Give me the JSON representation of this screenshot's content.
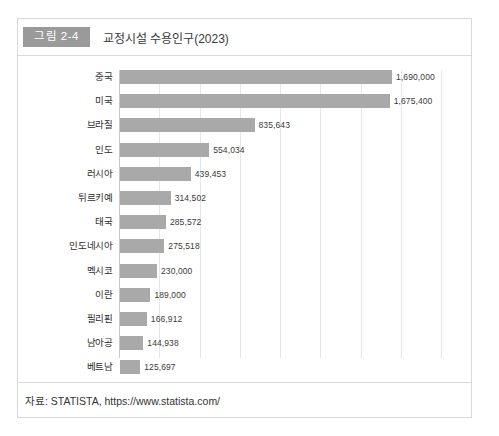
{
  "figure": {
    "badge": "그림 2-4",
    "title": "교정시설 수용인구(2023)",
    "source": "자료: STATISTA, https://www.statista.com/"
  },
  "colors": {
    "bar": "#a9a9a9",
    "badge_bg": "#9a9a9a",
    "grid": "#e6e6e6",
    "border": "#d9d9d9"
  },
  "chart_data": {
    "type": "bar",
    "orientation": "horizontal",
    "title": "교정시설 수용인구(2023)",
    "xlabel": "",
    "ylabel": "",
    "grid": true,
    "legend": "none",
    "xlim": [
      0,
      2000000
    ],
    "gridline_step": 250000,
    "categories": [
      "중국",
      "미국",
      "브라질",
      "인도",
      "러시아",
      "튀르키예",
      "태국",
      "인도네시아",
      "멕시코",
      "이란",
      "필리핀",
      "남아공",
      "베트남"
    ],
    "values": [
      1690000,
      1675400,
      835643,
      554034,
      439453,
      314502,
      285572,
      275518,
      230000,
      189000,
      166912,
      144938,
      125697
    ],
    "value_labels": [
      "1,690,000",
      "1,675,400",
      "835,643",
      "554,034",
      "439,453",
      "314,502",
      "285,572",
      "275,518",
      "230,000",
      "189,000",
      "166,912",
      "144,938",
      "125,697"
    ]
  }
}
